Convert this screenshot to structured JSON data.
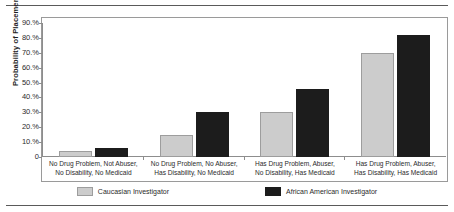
{
  "chart_data": {
    "type": "bar",
    "title": "",
    "xlabel": "",
    "ylabel": "Probability of Placement",
    "ylim": [
      0,
      90
    ],
    "grid": false,
    "legend_position": "bottom",
    "ytick_labels": [
      "90.%",
      "80.%",
      "70.%",
      "60.%",
      "50.%",
      "40.%",
      "30.%",
      "20.%",
      "10.%",
      "0"
    ],
    "ytick_values": [
      90,
      80,
      70,
      60,
      50,
      40,
      30,
      20,
      10,
      0
    ],
    "categories": [
      [
        "No Drug Problem, Not Abuser,",
        "No Disability, No Medicaid"
      ],
      [
        "No Drug Problem, No Abuser,",
        "Has Disability, No Medicaid"
      ],
      [
        "Has Drug Problem, Abuser,",
        "No Disability, Has Medicaid"
      ],
      [
        "Has Drug Problem, Abuser,",
        "Has Disability, Has Medicaid"
      ]
    ],
    "series": [
      {
        "name": "Caucasian Investigator",
        "color": "#cccccc",
        "values": [
          4,
          15,
          30,
          70
        ]
      },
      {
        "name": "African American Investigator",
        "color": "#1c1c1c",
        "values": [
          6,
          30,
          46,
          82
        ]
      }
    ]
  },
  "axis": {
    "y_title": "Probability of Placement"
  },
  "legend": {
    "items": [
      {
        "label": "Caucasian Investigator",
        "swatch": "caucasian-swatch"
      },
      {
        "label": "African American Investigator",
        "swatch": "african-american-swatch"
      }
    ]
  }
}
